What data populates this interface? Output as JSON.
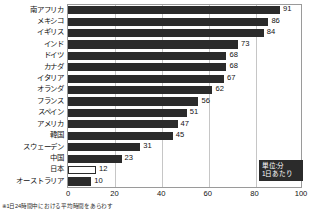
{
  "chart_data": {
    "type": "bar",
    "orientation": "horizontal",
    "title": "",
    "xlabel": "",
    "ylabel": "",
    "xlim": [
      0,
      100
    ],
    "xticks": [
      0,
      20,
      40,
      60,
      80,
      100
    ],
    "grid": true,
    "gridlines": [
      20,
      40,
      60,
      80
    ],
    "legend_position": "bottom-right",
    "categories": [
      "南アフリカ",
      "メキシコ",
      "イギリス",
      "インド",
      "ドイツ",
      "カナダ",
      "イタリア",
      "オランダ",
      "フランス",
      "スペイン",
      "アメリカ",
      "韓国",
      "スウェーデン",
      "中国",
      "日本",
      "オーストラリア"
    ],
    "values": [
      91,
      86,
      84,
      73,
      68,
      68,
      67,
      62,
      56,
      51,
      47,
      45,
      31,
      23,
      12,
      10
    ],
    "highlight_category": "日本",
    "bar_styles": [
      "filled",
      "filled",
      "filled",
      "filled",
      "filled",
      "filled",
      "filled",
      "filled",
      "filled",
      "filled",
      "filled",
      "filled",
      "filled",
      "filled",
      "hollow",
      "filled"
    ]
  },
  "legend": {
    "line1": "単位:分",
    "line2": "1日あたり"
  },
  "footnote": {
    "text": "※1日24時間中における平均時間をあらわす"
  },
  "colors": {
    "bar_fill": "#2b2b2b",
    "bar_hollow_fill": "#ffffff",
    "bar_outline": "#2b2b2b",
    "gridline": "#c6c6c6",
    "frame": "#9a9a9a",
    "legend_bg": "#2b2b2b",
    "legend_text": "#ffffff",
    "text": "#111111",
    "background": "#ffffff"
  }
}
